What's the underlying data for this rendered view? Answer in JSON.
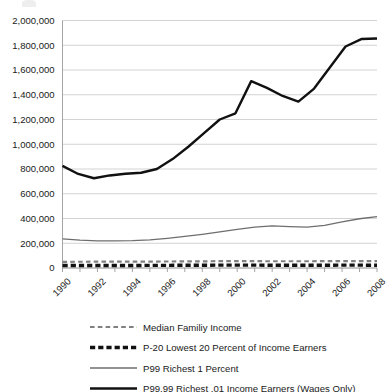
{
  "chart_data": {
    "type": "line",
    "title": "",
    "xlabel": "",
    "ylabel": "",
    "ylim": [
      0,
      2000000
    ],
    "xlim": [
      1990,
      2008
    ],
    "grid": "horizontal",
    "legend_position": "bottom",
    "x": [
      1990,
      1991,
      1992,
      1993,
      1994,
      1995,
      1996,
      1997,
      1998,
      1999,
      2000,
      2001,
      2002,
      2003,
      2004,
      2005,
      2006,
      2007,
      2008
    ],
    "ytick_labels": [
      "2,000,000",
      "1,800,000",
      "1,600,000",
      "1,400,000",
      "1,200,000",
      "1,000,000",
      "800,000",
      "600,000",
      "400,000",
      "200,000",
      "0"
    ],
    "ytick_values": [
      2000000,
      1800000,
      1600000,
      1400000,
      1200000,
      1000000,
      800000,
      600000,
      400000,
      200000,
      0
    ],
    "xtick_labels": [
      "1990",
      "1992",
      "1994",
      "1996",
      "1998",
      "2000",
      "2002",
      "2004",
      "2006",
      "2008"
    ],
    "xtick_values": [
      1990,
      1992,
      1994,
      1996,
      1998,
      2000,
      2002,
      2004,
      2006,
      2008
    ],
    "series": [
      {
        "name": "Median Familiy Income",
        "color": "#808080",
        "style": "dashed",
        "width": 2.2,
        "values": [
          50000,
          50500,
          51000,
          51000,
          51500,
          52000,
          52500,
          53000,
          54000,
          55000,
          55500,
          55000,
          54500,
          54500,
          54500,
          55000,
          55500,
          56000,
          55000
        ]
      },
      {
        "name": "P-20 Lowest 20 Percent of Income Earners",
        "color": "#111111",
        "style": "dashed",
        "width": 3.4,
        "values": [
          20000,
          20000,
          20000,
          20500,
          20500,
          21000,
          21500,
          22000,
          22500,
          23000,
          23500,
          23000,
          22500,
          22500,
          22500,
          22500,
          23000,
          23000,
          22500
        ]
      },
      {
        "name": "P99 Richest 1 Percent",
        "color": "#6e6e6e",
        "style": "solid",
        "width": 1.3,
        "values": [
          235000,
          225000,
          220000,
          220000,
          222000,
          228000,
          240000,
          255000,
          272000,
          292000,
          312000,
          330000,
          340000,
          335000,
          330000,
          345000,
          372000,
          398000,
          415000
        ]
      },
      {
        "name": "P99.99 Richest .01 Income Earners (Wages Only)",
        "color": "#111111",
        "style": "solid",
        "width": 2.4,
        "values": [
          825000,
          775000,
          725000,
          750000,
          760000,
          770000,
          790000,
          830000,
          920000,
          1030000,
          1130000,
          1205000,
          1250000,
          1510000,
          1455000,
          1400000,
          1345000,
          1430000,
          1855000
        ]
      }
    ],
    "series_plot_values": {
      "P99.99 Richest .01 Income Earners (Wages Only)": [
        825000,
        760000,
        725000,
        748000,
        762000,
        770000,
        800000,
        880000,
        980000,
        1090000,
        1200000,
        1250000,
        1510000,
        1455000,
        1390000,
        1345000,
        1450000,
        1620000,
        1790000,
        1850000,
        1855000
      ]
    }
  },
  "legend": {
    "items": [
      {
        "label": "Median Familiy Income",
        "swatch": "gray-dashed-thin"
      },
      {
        "label": "P-20 Lowest 20 Percent of Income Earners",
        "swatch": "black-dashed-thick"
      },
      {
        "label": "P99 Richest 1 Percent",
        "swatch": "gray-solid-thin"
      },
      {
        "label": "P99.99 Richest .01 Income Earners (Wages Only)",
        "swatch": "black-solid-thick"
      }
    ]
  },
  "colors": {
    "gridline": "#c8c8c8",
    "axis": "#9a9a9a",
    "black_series": "#111111",
    "gray_series": "#6e6e6e",
    "gray_dashed": "#808080",
    "background": "#ffffff"
  }
}
